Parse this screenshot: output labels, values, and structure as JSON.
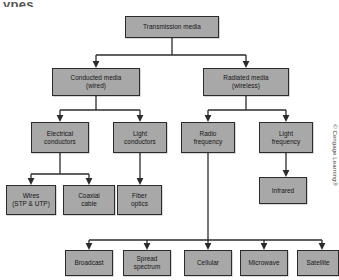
{
  "figure": {
    "partial_caption": "ypes",
    "credit": "© Cengage Learning®",
    "colors": {
      "box_fill": "#a8a8a8",
      "box_border": "#2b2b2b",
      "connector": "#2b2b2b",
      "background": "#ffffff",
      "text": "#141414"
    }
  },
  "diagram": {
    "type": "tree",
    "title": "Transmission media",
    "nodes": {
      "root": "Transmission media",
      "conducted": "Conducted media\n(wired)",
      "radiated": "Radiated media\n(wireless)",
      "electrical_conductors": "Electrical\nconductors",
      "light_conductors": "Light\nconductors",
      "radio_frequency": "Radio\nfrequency",
      "light_frequency": "Light\nfrequency",
      "wires": "Wires\n(STP & UTP)",
      "coaxial_cable": "Coaxial\ncable",
      "fiber_optics": "Fiber\noptics",
      "infrared": "Infrared",
      "broadcast": "Broadcast",
      "spread_spectrum": "Spread\nspectrum",
      "cellular": "Cellular",
      "microwave": "Microwave",
      "satellite": "Satellite"
    },
    "edges": [
      {
        "from": "root",
        "to": "conducted"
      },
      {
        "from": "root",
        "to": "radiated"
      },
      {
        "from": "conducted",
        "to": "electrical_conductors"
      },
      {
        "from": "conducted",
        "to": "light_conductors"
      },
      {
        "from": "radiated",
        "to": "radio_frequency"
      },
      {
        "from": "radiated",
        "to": "light_frequency"
      },
      {
        "from": "electrical_conductors",
        "to": "wires"
      },
      {
        "from": "electrical_conductors",
        "to": "coaxial_cable"
      },
      {
        "from": "light_conductors",
        "to": "fiber_optics"
      },
      {
        "from": "light_frequency",
        "to": "infrared"
      },
      {
        "from": "radio_frequency",
        "to": "broadcast"
      },
      {
        "from": "radio_frequency",
        "to": "spread_spectrum"
      },
      {
        "from": "radio_frequency",
        "to": "cellular"
      },
      {
        "from": "radio_frequency",
        "to": "microwave"
      },
      {
        "from": "radio_frequency",
        "to": "satellite"
      }
    ]
  }
}
